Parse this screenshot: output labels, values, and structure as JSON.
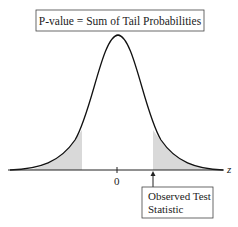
{
  "title_box": {
    "text": "P-value = Sum of Tail Probabilities"
  },
  "axis": {
    "variable": "z",
    "center_label": "0"
  },
  "callout": {
    "line1": "Observed Test",
    "line2": "Statistic"
  },
  "colors": {
    "curve": "#111111",
    "shade": "#d9d9d9",
    "axis": "#222222",
    "box_border": "#444444"
  }
}
